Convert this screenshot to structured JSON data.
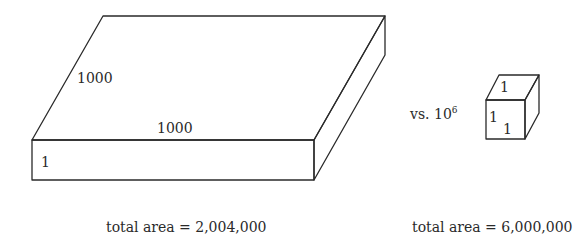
{
  "slab": {
    "depth_label": "1000",
    "width_label": "1000",
    "height_label": "1",
    "total_area_label": "total area = 2,004,000"
  },
  "comparison": {
    "vs_text": "vs. 10",
    "exponent": "6"
  },
  "cube": {
    "top_label": "1",
    "left_label": "1",
    "front_label": "1",
    "total_area_label": "total area = 6,000,000"
  }
}
